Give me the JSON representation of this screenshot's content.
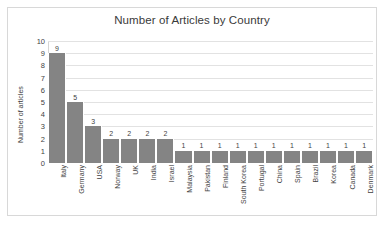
{
  "chart_data": {
    "type": "bar",
    "title": "Number of Articles by Country",
    "xlabel": "",
    "ylabel": "Number of articles",
    "ylim": [
      0,
      10
    ],
    "yticks": [
      10,
      9,
      8,
      7,
      6,
      5,
      4,
      3,
      2,
      1,
      0
    ],
    "grid": true,
    "legend": false,
    "bar_color": "#848484",
    "data_labels": true,
    "categories": [
      "Italy",
      "Germany",
      "USA",
      "Norway",
      "UK",
      "India",
      "Israel",
      "Malaysia",
      "Pakistan",
      "Finland",
      "South Korea",
      "Portugal",
      "China",
      "Spain",
      "Brazil",
      "Korea",
      "Canada",
      "Denmark"
    ],
    "values": [
      9,
      5,
      3,
      2,
      2,
      2,
      2,
      1,
      1,
      1,
      1,
      1,
      1,
      1,
      1,
      1,
      1,
      1
    ]
  },
  "caption": ""
}
